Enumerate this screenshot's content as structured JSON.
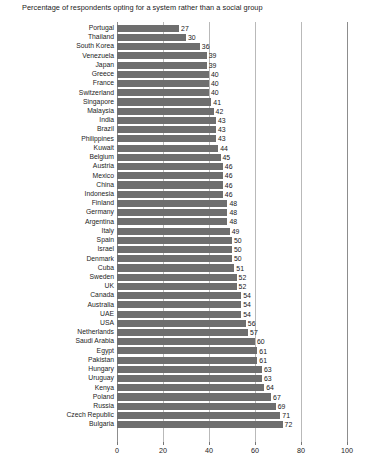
{
  "chart_data": {
    "type": "bar",
    "orientation": "horizontal",
    "title": "Percentage of respondents opting for a system rather than a social group",
    "xlabel": "",
    "ylabel": "",
    "xlim": [
      0,
      100
    ],
    "xticks": [
      0,
      20,
      40,
      60,
      80,
      100
    ],
    "grid": true,
    "legend": false,
    "bar_color": "#6e6e6e",
    "categories": [
      "Portugal",
      "Thailand",
      "South Korea",
      "Venezuela",
      "Japan",
      "Greece",
      "France",
      "Switzerland",
      "Singapore",
      "Malaysia",
      "India",
      "Brazil",
      "Philippines",
      "Kuwait",
      "Belgium",
      "Austria",
      "Mexico",
      "China",
      "Indonesia",
      "Finland",
      "Germany",
      "Argentina",
      "Italy",
      "Spain",
      "Israel",
      "Denmark",
      "Cuba",
      "Sweden",
      "UK",
      "Canada",
      "Australia",
      "UAE",
      "USA",
      "Netherlands",
      "Saudi Arabia",
      "Egypt",
      "Pakistan",
      "Hungary",
      "Uruguay",
      "Kenya",
      "Poland",
      "Russia",
      "Czech Republic",
      "Bulgaria"
    ],
    "values": [
      27,
      30,
      36,
      39,
      39,
      40,
      40,
      40,
      41,
      42,
      43,
      43,
      43,
      44,
      45,
      46,
      46,
      46,
      46,
      48,
      48,
      48,
      49,
      50,
      50,
      50,
      51,
      52,
      52,
      54,
      54,
      54,
      56,
      57,
      60,
      61,
      61,
      63,
      63,
      64,
      67,
      69,
      71,
      72
    ]
  }
}
